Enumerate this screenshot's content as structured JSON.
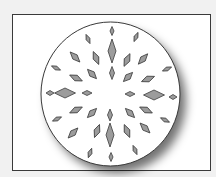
{
  "figure": {
    "frame": {
      "x": 12,
      "y": 14,
      "w": 199,
      "h": 157
    },
    "circle": {
      "cx": 110.5,
      "cy": 94,
      "rx": 69.5,
      "ry": 72,
      "fill": "#ffffff",
      "stroke": "#3a3a3a"
    },
    "diamond_fill": "#9c9c9c",
    "diamond_stroke": "#3c3c3c",
    "diamonds": [
      {
        "cx": 112,
        "cy": 31,
        "len": 9,
        "wid": 4,
        "rot": 0
      },
      {
        "cx": 112,
        "cy": 51,
        "len": 24,
        "wid": 8,
        "rot": 0
      },
      {
        "cx": 112,
        "cy": 73,
        "len": 13,
        "wid": 5,
        "rot": 0
      },
      {
        "cx": 110,
        "cy": 115,
        "len": 12,
        "wid": 5,
        "rot": 0
      },
      {
        "cx": 110,
        "cy": 135,
        "len": 24,
        "wid": 8,
        "rot": 0
      },
      {
        "cx": 111,
        "cy": 157,
        "len": 9,
        "wid": 4,
        "rot": 0
      },
      {
        "cx": 88,
        "cy": 39,
        "len": 10,
        "wid": 4,
        "rot": -23
      },
      {
        "cx": 136,
        "cy": 37,
        "len": 10,
        "wid": 4,
        "rot": 24
      },
      {
        "cx": 75,
        "cy": 57,
        "len": 14,
        "wid": 6,
        "rot": -44
      },
      {
        "cx": 96,
        "cy": 58,
        "len": 14,
        "wid": 6,
        "rot": -23
      },
      {
        "cx": 127,
        "cy": 60,
        "len": 14,
        "wid": 6,
        "rot": 25
      },
      {
        "cx": 143,
        "cy": 59,
        "len": 14,
        "wid": 6,
        "rot": 42
      },
      {
        "cx": 56,
        "cy": 68,
        "len": 10,
        "wid": 4,
        "rot": -65
      },
      {
        "cx": 76,
        "cy": 78,
        "len": 14,
        "wid": 6,
        "rot": -65
      },
      {
        "cx": 92,
        "cy": 74,
        "len": 13,
        "wid": 6,
        "rot": -44
      },
      {
        "cx": 128,
        "cy": 77,
        "len": 13,
        "wid": 6,
        "rot": 45
      },
      {
        "cx": 148,
        "cy": 79,
        "len": 14,
        "wid": 6,
        "rot": 68
      },
      {
        "cx": 167,
        "cy": 69,
        "len": 10,
        "wid": 4,
        "rot": 66
      },
      {
        "cx": 50,
        "cy": 93,
        "len": 8,
        "wid": 5,
        "rot": 90
      },
      {
        "cx": 65,
        "cy": 93,
        "len": 21,
        "wid": 10,
        "rot": 90
      },
      {
        "cx": 87,
        "cy": 93,
        "len": 10,
        "wid": 5,
        "rot": 90
      },
      {
        "cx": 130,
        "cy": 94,
        "len": 10,
        "wid": 5,
        "rot": 90
      },
      {
        "cx": 154,
        "cy": 95,
        "len": 21,
        "wid": 10,
        "rot": 90
      },
      {
        "cx": 173,
        "cy": 97,
        "len": 8,
        "wid": 5,
        "rot": 90
      },
      {
        "cx": 57,
        "cy": 119,
        "len": 10,
        "wid": 4,
        "rot": 65
      },
      {
        "cx": 76,
        "cy": 110,
        "len": 14,
        "wid": 6,
        "rot": 65
      },
      {
        "cx": 92,
        "cy": 113,
        "len": 13,
        "wid": 6,
        "rot": 45
      },
      {
        "cx": 73,
        "cy": 133,
        "len": 14,
        "wid": 6,
        "rot": 44
      },
      {
        "cx": 97,
        "cy": 131,
        "len": 14,
        "wid": 6,
        "rot": 21
      },
      {
        "cx": 90,
        "cy": 153,
        "len": 10,
        "wid": 4,
        "rot": 20
      },
      {
        "cx": 130,
        "cy": 113,
        "len": 13,
        "wid": 6,
        "rot": -45
      },
      {
        "cx": 146,
        "cy": 110,
        "len": 14,
        "wid": 6,
        "rot": -65
      },
      {
        "cx": 165,
        "cy": 120,
        "len": 10,
        "wid": 4,
        "rot": -64
      },
      {
        "cx": 127,
        "cy": 131,
        "len": 14,
        "wid": 6,
        "rot": -23
      },
      {
        "cx": 145,
        "cy": 128,
        "len": 14,
        "wid": 6,
        "rot": -45
      },
      {
        "cx": 135,
        "cy": 150,
        "len": 10,
        "wid": 4,
        "rot": -23
      }
    ]
  }
}
